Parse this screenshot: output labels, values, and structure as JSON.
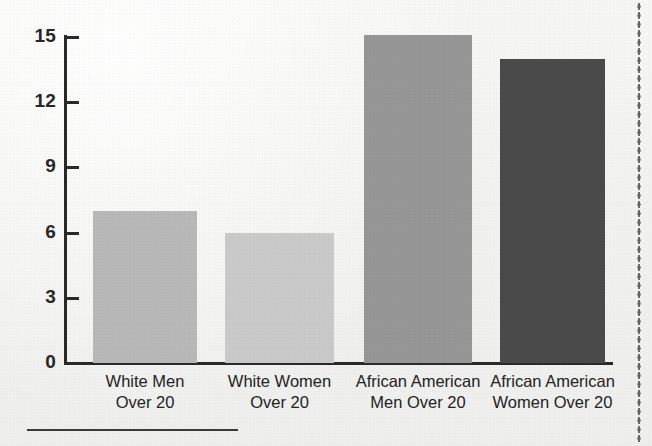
{
  "figure": {
    "background_color": "#f2f2f0",
    "axis_color": "#2a2a2a",
    "bottom_rule_name": "horizontal-rule",
    "right_edge_name": "dotted-margin-line"
  },
  "chart_data": {
    "type": "bar",
    "title": "",
    "subtitle": "",
    "xlabel": "",
    "ylabel": "",
    "categories": [
      "White Men Over 20",
      "White Women Over 20",
      "African American Men Over 20",
      "African American Women Over 20"
    ],
    "category_lines": [
      {
        "line1": "White Men",
        "line2": "Over 20"
      },
      {
        "line1": "White Women",
        "line2": "Over 20"
      },
      {
        "line1": "African American",
        "line2": "Men Over 20"
      },
      {
        "line1": "African American",
        "line2": "Women Over 20"
      }
    ],
    "values": [
      7,
      6,
      15.1,
      14
    ],
    "bar_colors": [
      "#b8b8b8",
      "#c9c9c9",
      "#969696",
      "#4a4a4a"
    ],
    "ylim": [
      0,
      15
    ],
    "yticks": [
      0,
      3,
      6,
      9,
      12,
      15
    ],
    "ytick_labels": [
      "0",
      "3",
      "6",
      "9",
      "12",
      "15"
    ],
    "grid": false,
    "legend": null,
    "annotations": []
  },
  "axis": {
    "y_labels": [
      "15",
      "12",
      "9",
      "6",
      "3",
      "0"
    ]
  }
}
